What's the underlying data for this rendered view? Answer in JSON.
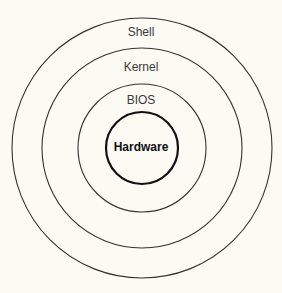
{
  "diagram": {
    "title": "",
    "type": "concentric-layers",
    "background": "#fbfaf3",
    "center": {
      "x": 142,
      "y": 148
    },
    "layers": [
      {
        "label": "Shell",
        "radius": 130,
        "stroke": "#333333",
        "stroke_width": 1.1,
        "label_y": 25,
        "bold": false
      },
      {
        "label": "Kernel",
        "radius": 100,
        "stroke": "#333333",
        "stroke_width": 1.1,
        "label_y": 60,
        "bold": false
      },
      {
        "label": "BIOS",
        "radius": 64,
        "stroke": "#333333",
        "stroke_width": 1.1,
        "label_y": 93,
        "bold": false
      },
      {
        "label": "Hardware",
        "radius": 36,
        "stroke": "#111111",
        "stroke_width": 2.2,
        "label_y": 140,
        "bold": true
      }
    ]
  }
}
